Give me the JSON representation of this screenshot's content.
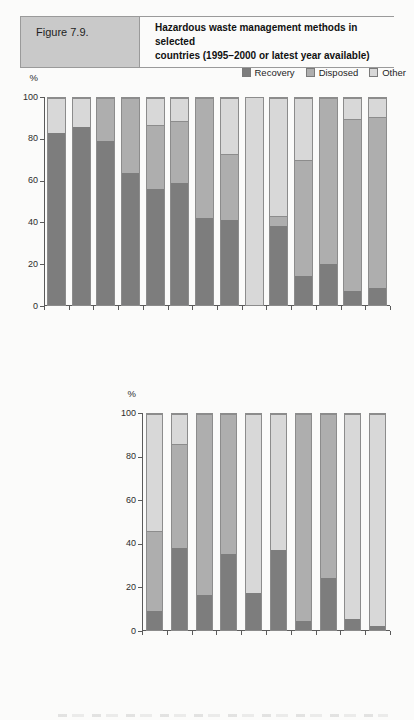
{
  "header": {
    "figure_label": "Figure 7.9.",
    "title_line1": "Hazardous waste management methods in selected",
    "title_line2": "countries (1995–2000 or latest year available)"
  },
  "legend": {
    "items": [
      {
        "key": "recovery",
        "label": "Recovery"
      },
      {
        "key": "disposed",
        "label": "Disposed"
      },
      {
        "key": "other",
        "label": "Other"
      }
    ]
  },
  "colors": {
    "recovery": "#7d7d7d",
    "disposed": "#aeaeae",
    "other": "#d8d8d8",
    "bar_border": "#8c8c8c",
    "axis": "#5a5a5a",
    "header_box_bg": "#c9c9c9"
  },
  "chart_data": [
    {
      "type": "bar",
      "subtype": "stacked-percent",
      "ylabel": "%",
      "ylim": [
        0,
        100
      ],
      "yticks": [
        0,
        20,
        40,
        60,
        80,
        100
      ],
      "grid": false,
      "legend_position": "top-right",
      "categories": [
        "Iceland 1995",
        "2000",
        "Denmark 1995",
        "2000",
        "France 1995",
        "2000",
        "Ireland 1995",
        "1998",
        "Luxembourg 1995",
        "2000",
        "Netherlands 1995",
        "2000",
        "Switzerland 1995",
        "1998"
      ],
      "series": [
        {
          "key": "recovery",
          "name": "Recovery",
          "values": [
            83,
            86,
            79,
            64,
            56,
            59,
            42,
            41,
            0,
            38,
            14,
            20,
            7,
            8
          ]
        },
        {
          "key": "disposed",
          "name": "Disposed",
          "values": [
            0,
            0,
            21,
            36,
            31,
            30,
            58,
            32,
            0,
            5,
            56,
            80,
            83,
            83
          ]
        },
        {
          "key": "other",
          "name": "Other",
          "values": [
            17,
            14,
            0,
            0,
            13,
            11,
            0,
            27,
            100,
            57,
            30,
            0,
            10,
            9
          ]
        }
      ]
    },
    {
      "type": "bar",
      "subtype": "stacked-percent",
      "ylabel": "%",
      "ylim": [
        0,
        100
      ],
      "yticks": [
        0,
        20,
        40,
        60,
        80,
        100
      ],
      "grid": false,
      "categories": [
        "Czech Republic 1995",
        "2000",
        "Ukraine 1995",
        "2000",
        "Bulgaria 1996",
        "2000",
        "Romania 1995",
        "2000",
        "Estonia 1995",
        "2000"
      ],
      "series": [
        {
          "key": "recovery",
          "name": "Recovery",
          "values": [
            9,
            38,
            16,
            35,
            17,
            37,
            4,
            24,
            5,
            2
          ]
        },
        {
          "key": "disposed",
          "name": "Disposed",
          "values": [
            37,
            48,
            84,
            65,
            0,
            0,
            96,
            76,
            0,
            0
          ]
        },
        {
          "key": "other",
          "name": "Other",
          "values": [
            54,
            14,
            0,
            0,
            83,
            63,
            0,
            0,
            95,
            98
          ]
        }
      ]
    }
  ]
}
